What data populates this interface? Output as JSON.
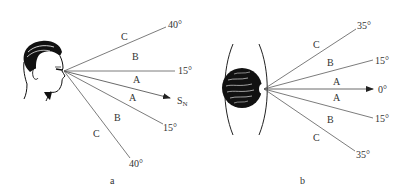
{
  "figure": {
    "panel_a": {
      "caption": "a",
      "rays": [
        {
          "angle_label": "40°",
          "position": "upper"
        },
        {
          "angle_label": "15°",
          "position": "upper"
        },
        {
          "angle_label": "S",
          "subscript": "N",
          "position": "center-arrow"
        },
        {
          "angle_label": "15°",
          "position": "lower"
        },
        {
          "angle_label": "40°",
          "position": "lower"
        }
      ],
      "zones": [
        "C",
        "B",
        "A",
        "A",
        "B",
        "C"
      ]
    },
    "panel_b": {
      "caption": "b",
      "rays": [
        {
          "angle_label": "35°",
          "position": "upper"
        },
        {
          "angle_label": "15°",
          "position": "upper"
        },
        {
          "angle_label": "0°",
          "position": "center-arrow"
        },
        {
          "angle_label": "15°",
          "position": "lower"
        },
        {
          "angle_label": "35°",
          "position": "lower"
        }
      ],
      "zones": [
        "C",
        "B",
        "A",
        "A",
        "B",
        "C"
      ]
    },
    "colors": {
      "line": "#5a5a5a",
      "text": "#333333",
      "ink": "#111111"
    }
  }
}
